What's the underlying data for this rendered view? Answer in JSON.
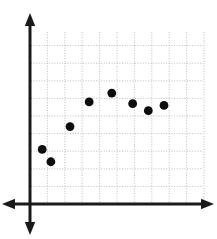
{
  "chart_data": {
    "type": "scatter",
    "title": "",
    "subtitle": "",
    "xlabel": "",
    "ylabel": "",
    "grid": true,
    "grid_style": "dotted",
    "legend": false,
    "legend_position": "none",
    "axis_style": "double-headed arrows through origin",
    "xlim": [
      0,
      10
    ],
    "ylim": [
      0,
      10
    ],
    "x_tick_labels": [],
    "y_tick_labels": [],
    "x_gridlines": [
      1,
      2,
      3,
      4,
      5,
      6,
      7,
      8,
      9,
      10
    ],
    "y_gridlines": [
      1,
      2,
      3,
      4,
      5,
      6,
      7,
      8,
      9
    ],
    "annotations": [],
    "series": [
      {
        "name": "Series 1",
        "marker": "filled-circle",
        "color": "#0d0d0d",
        "points": [
          {
            "x": 0.7,
            "y": 3.1
          },
          {
            "x": 1.2,
            "y": 2.4
          },
          {
            "x": 2.3,
            "y": 4.4
          },
          {
            "x": 3.4,
            "y": 5.8
          },
          {
            "x": 4.7,
            "y": 6.3
          },
          {
            "x": 5.9,
            "y": 5.7
          },
          {
            "x": 6.8,
            "y": 5.3
          },
          {
            "x": 7.7,
            "y": 5.6
          }
        ]
      }
    ]
  },
  "geometry": {
    "width": 217,
    "height": 239,
    "origin_x": 30,
    "origin_y": 204,
    "x_step": 17.4,
    "y_step": 17.6,
    "plot_right": 203,
    "plot_top": 32,
    "point_radius": 4.4,
    "background": "#ffffff",
    "grid_color": "#b8b8b8",
    "axis_color": "#1a1a1a"
  }
}
